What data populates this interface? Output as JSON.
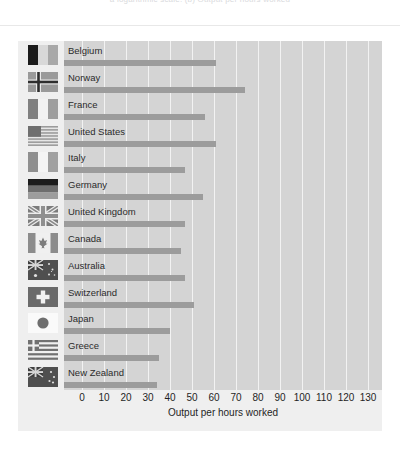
{
  "caption": {
    "text": "a logarithmic scale. (b) Output per hours worked"
  },
  "chart_data": {
    "type": "bar",
    "orientation": "horizontal",
    "title": "",
    "xlabel": "Output per hours worked",
    "ylabel": "",
    "xlim": [
      0,
      130
    ],
    "xticks": [
      0,
      10,
      20,
      30,
      40,
      50,
      60,
      70,
      80,
      90,
      100,
      110,
      120,
      130
    ],
    "grid": true,
    "legend": "none",
    "bar_color": "#9c9c9c",
    "plot_background": "#d4d4d4",
    "panel_background": "#efefef",
    "categories": [
      "Belgium",
      "Norway",
      "France",
      "United States",
      "Italy",
      "Germany",
      "United Kingdom",
      "Canada",
      "Australia",
      "Switzerland",
      "Japan",
      "Greece",
      "New Zealand"
    ],
    "values": [
      61,
      74,
      56,
      61,
      47,
      55,
      47,
      45,
      47,
      51,
      40,
      35,
      34
    ],
    "flags": [
      "flag-belgium",
      "flag-norway",
      "flag-france",
      "flag-united-states",
      "flag-italy",
      "flag-germany",
      "flag-united-kingdom",
      "flag-canada",
      "flag-australia",
      "flag-switzerland",
      "flag-japan",
      "flag-greece",
      "flag-new-zealand"
    ]
  }
}
